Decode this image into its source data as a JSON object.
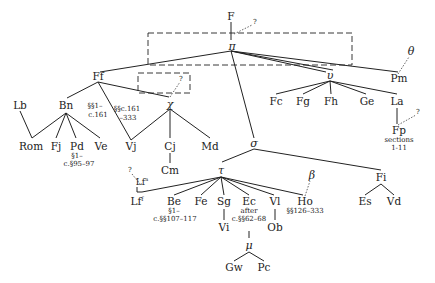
{
  "diagram": {
    "type": "stemma codicum",
    "nodes": {
      "F": "F",
      "q_top": "?",
      "pi": "π",
      "Ff": "Ff",
      "upsilon": "υ",
      "Pm": "Pm",
      "theta": "θ",
      "Lb": "Lb",
      "Bn": "Bn",
      "Rom": "Rom",
      "Fj": "Fj",
      "Pd": "Pd",
      "Ve": "Ve",
      "Vj": "Vj",
      "chi": "χ",
      "q_chi": "?",
      "Cj": "Cj",
      "Md": "Md",
      "Cm": "Cm",
      "Fc": "Fc",
      "Fg": "Fg",
      "Fh": "Fh",
      "Ge": "Ge",
      "La": "La",
      "Fp": "Fp",
      "q_fp": "?",
      "sigma": "σ",
      "tau": "τ",
      "Fi": "Fi",
      "beta": "β",
      "Lf": "Lf",
      "Lf_sup": "f",
      "Lfa": "Lf",
      "Lfa_sup": "a",
      "q_lf": "?",
      "Be": "Be",
      "Fe": "Fe",
      "Sg": "Sg",
      "Ec": "Ec",
      "Vl": "Vl",
      "Ho": "Ho",
      "Es": "Es",
      "Vd": "Vd",
      "Vi": "Vi",
      "Ob": "Ob",
      "mu": "μ",
      "Gw": "Gw",
      "Pc": "Pc"
    },
    "notes": {
      "ff_vj_1": "§§1–",
      "ff_vj_2": "c.161",
      "chi_vj_1": "§§c.161",
      "chi_vj_2": "–333",
      "pd_1": "§1–",
      "pd_2": "c.§95–97",
      "fp_1": "sections",
      "fp_2": "1-11",
      "be_1": "§1–",
      "be_2": "c.§§107–117",
      "ec_1": "after",
      "ec_2": "c.§§62–68",
      "ho_1": "§§126–333"
    }
  }
}
